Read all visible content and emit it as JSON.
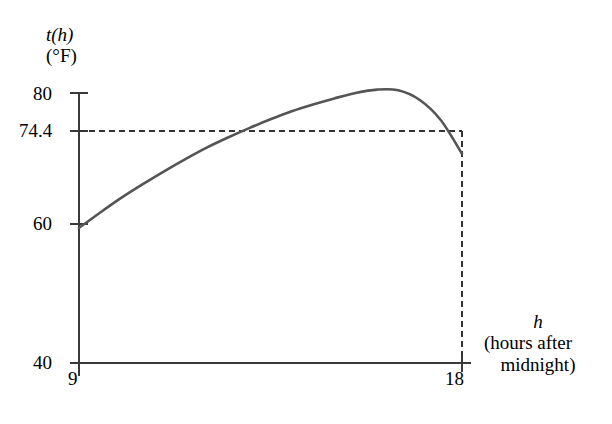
{
  "chart_data": {
    "type": "line",
    "title": "",
    "subtitle": "",
    "xlabel": "h (hours after midnight)",
    "ylabel": "t(h) (°F)",
    "xlim": [
      9,
      18
    ],
    "ylim": [
      40,
      80
    ],
    "grid": false,
    "legend": null,
    "x_tick_labels": [
      "9",
      "18"
    ],
    "x_ticks": [
      9,
      18
    ],
    "y_tick_labels": [
      "40",
      "60",
      "74.4",
      "80"
    ],
    "y_ticks": [
      40,
      60,
      74.4,
      80
    ],
    "series": [
      {
        "name": "t(h)",
        "color": "#555555",
        "x": [
          9.0,
          9.5,
          10.0,
          10.5,
          11.0,
          11.5,
          12.0,
          12.5,
          13.0,
          13.5,
          14.0,
          14.5,
          15.0,
          15.5,
          16.0,
          16.5,
          17.0,
          17.5,
          18.0
        ],
        "values": [
          60.0,
          62.3,
          64.5,
          66.5,
          68.4,
          70.2,
          71.9,
          73.4,
          74.8,
          76.1,
          77.3,
          78.3,
          79.2,
          80.0,
          80.5,
          80.4,
          79.0,
          76.0,
          71.0
        ]
      }
    ],
    "annotations": [
      {
        "name": "horizontal-reference-line",
        "type": "dashed-horizontal",
        "y": 74.4,
        "x_from": 9,
        "x_to": 18,
        "label": "74.4"
      },
      {
        "name": "vertical-reference-line",
        "type": "dashed-vertical",
        "x": 18,
        "y_from": 40,
        "y_to": 74.4,
        "label": "18"
      }
    ]
  },
  "labels": {
    "y_axis_title_line1": "t(h)",
    "y_axis_title_line2": "(°F)",
    "x_axis_symbol": "h",
    "x_axis_title_line1": "(hours after",
    "x_axis_title_line2": "midnight)",
    "tick_80": "80",
    "tick_744": "74.4",
    "tick_60": "60",
    "tick_40": "40",
    "tick_9": "9",
    "tick_18": "18"
  },
  "colors": {
    "curve": "#555555",
    "axis": "#3a3a3a",
    "dashed": "#333333",
    "background": "#ffffff",
    "text": "#000000"
  }
}
